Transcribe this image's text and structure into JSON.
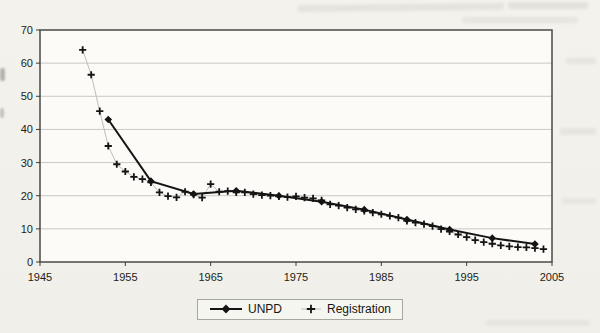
{
  "chart_data": {
    "type": "line",
    "title": "",
    "xlabel": "",
    "ylabel": "",
    "xlim": [
      1945,
      2005
    ],
    "ylim": [
      0,
      70
    ],
    "xticks": [
      1945,
      1955,
      1965,
      1975,
      1985,
      1995,
      2005
    ],
    "yticks": [
      0,
      10,
      20,
      30,
      40,
      50,
      60,
      70
    ],
    "grid": "horizontal-only",
    "legend_position": "bottom-center",
    "plot_border_color": "#4a4a46",
    "gridline_color": "#c9c8c2",
    "series": [
      {
        "name": "UNPD",
        "type": "line",
        "marker": "filled-diamond",
        "color": "#141414",
        "x": [
          1953,
          1958,
          1963,
          1968,
          1973,
          1978,
          1983,
          1988,
          1993,
          1998,
          2003
        ],
        "values": [
          43,
          24.4,
          20.5,
          21.5,
          20,
          18.2,
          15.8,
          12.8,
          9.8,
          7.2,
          5.4
        ]
      },
      {
        "name": "Registration",
        "type": "line",
        "marker": "plus",
        "color": "#141414",
        "line_color": "#c0beb7",
        "x": [
          1950,
          1951,
          1952,
          1953,
          1954,
          1955,
          1956,
          1957,
          1958,
          1959,
          1960,
          1961,
          1962,
          1963,
          1964,
          1965,
          1966,
          1967,
          1968,
          1969,
          1970,
          1971,
          1972,
          1973,
          1974,
          1975,
          1976,
          1977,
          1978,
          1979,
          1980,
          1981,
          1982,
          1983,
          1984,
          1985,
          1986,
          1987,
          1988,
          1989,
          1990,
          1991,
          1992,
          1993,
          1994,
          1995,
          1996,
          1997,
          1998,
          1999,
          2000,
          2001,
          2002,
          2003,
          2004
        ],
        "values": [
          64,
          56.5,
          45.5,
          35,
          29.5,
          27.3,
          25.7,
          25,
          24,
          21,
          19.9,
          19.5,
          21.2,
          20.3,
          19.4,
          23.5,
          21.2,
          21.4,
          21,
          21,
          20.5,
          20.2,
          20,
          19.8,
          19.6,
          19.8,
          19.4,
          19.2,
          18.6,
          17.4,
          17,
          16.4,
          15.9,
          15.4,
          14.9,
          14.4,
          13.9,
          13.4,
          12.4,
          11.9,
          11.4,
          10.8,
          9.9,
          9.2,
          8.3,
          7.5,
          6.6,
          6.0,
          5.5,
          5.0,
          4.7,
          4.5,
          4.4,
          4.2,
          3.9
        ]
      }
    ]
  }
}
